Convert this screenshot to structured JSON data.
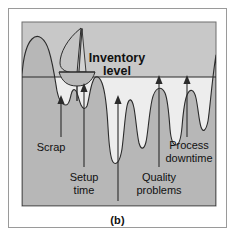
{
  "figure": {
    "caption": "(b)",
    "frame_border_color": "#9a9a9a",
    "background_color": "#ffffff"
  },
  "diagram": {
    "type": "conceptual-illustration",
    "metaphor": "rocks-and-water inventory metaphor",
    "water_fill_color": "#ededed",
    "rock_fill_color": "#b7b7b7",
    "outline_color": "#2b2b2b",
    "panel_fill_color": "#c8c8c8",
    "title_label": {
      "line1": "Inventory",
      "line2": "level"
    },
    "waterline": {
      "name": "inventory-level-waterline",
      "y": 76,
      "x_start": 22,
      "x_end": 215
    },
    "boat": {
      "name": "sailboat",
      "hull_color": "#b9b9b9",
      "sail_color": "#c4c4c4"
    },
    "rock_labels": [
      {
        "id": "scrap",
        "text": "Scrap",
        "arrow_from_y": 128,
        "arrow_to_y": 98,
        "arrow_x": 62
      },
      {
        "id": "setup-time",
        "line1": "Setup",
        "line2": "time",
        "arrow_from_y": 155,
        "arrow_to_y": 84,
        "arrow_x": 84
      },
      {
        "id": "late-deliveries",
        "text": "Late deliveries",
        "arrow_from_y": 190,
        "arrow_to_y": 96,
        "arrow_x": 118
      },
      {
        "id": "quality-problems",
        "line1": "Quality",
        "line2": "problems",
        "arrow_from_y": 155,
        "arrow_to_y": 77,
        "arrow_x": 160
      },
      {
        "id": "process-downtime",
        "line1": "Process",
        "line2": "downtime",
        "arrow_from_y": 128,
        "arrow_to_y": 78,
        "arrow_x": 183
      }
    ],
    "labels": {
      "scrap": "Scrap",
      "setup_time_1": "Setup",
      "setup_time_2": "time",
      "late_deliveries": "Late deliveries",
      "quality_1": "Quality",
      "quality_2": "problems",
      "process_1": "Process",
      "process_2": "downtime"
    }
  }
}
